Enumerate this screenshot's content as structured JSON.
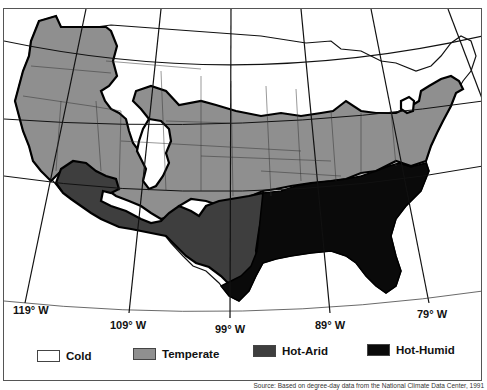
{
  "map": {
    "title": "",
    "regions": [
      "Cold",
      "Temperate",
      "Hot-Arid",
      "Hot-Humid"
    ],
    "colors": {
      "cold": "#ffffff",
      "temperate": "#8f8f8f",
      "hot_arid": "#3e3e3e",
      "hot_humid": "#0a0a0a",
      "outline": "#000000"
    }
  },
  "longitude_labels": [
    {
      "label": "119° W"
    },
    {
      "label": "109° W"
    },
    {
      "label": "99° W"
    },
    {
      "label": "89° W"
    },
    {
      "label": "79° W"
    }
  ],
  "legend": {
    "items": [
      {
        "label": "Cold",
        "color": "#ffffff"
      },
      {
        "label": "Temperate",
        "color": "#8f8f8f"
      },
      {
        "label": "Hot-Arid",
        "color": "#3e3e3e"
      },
      {
        "label": "Hot-Humid",
        "color": "#0a0a0a"
      }
    ]
  },
  "source": "Source: Based on degree-day data from the National Climate Data Center, 1991"
}
